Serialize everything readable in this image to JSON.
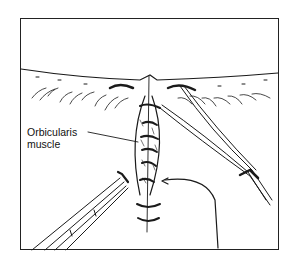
{
  "figure": {
    "labels": [
      {
        "text_line1": "Orbicularis",
        "text_line2": "muscle"
      }
    ],
    "colors": {
      "line": "#1a1a1a",
      "background": "#ffffff"
    }
  }
}
